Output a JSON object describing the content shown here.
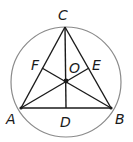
{
  "diagram": {
    "type": "geometry",
    "circle": {
      "cx": 66,
      "cy": 82,
      "r": 55,
      "stroke": "#8a8a8a"
    },
    "points": {
      "A": {
        "x": 21,
        "y": 108,
        "label": "A"
      },
      "B": {
        "x": 111,
        "y": 108,
        "label": "B"
      },
      "C": {
        "x": 65,
        "y": 27,
        "label": "C"
      },
      "D": {
        "x": 66,
        "y": 108,
        "label": "D"
      },
      "E": {
        "x": 89,
        "y": 68,
        "label": "E"
      },
      "F": {
        "x": 42,
        "y": 68,
        "label": "F"
      },
      "O": {
        "x": 66,
        "y": 81,
        "label": "O"
      }
    },
    "segments": [
      "AB",
      "BC",
      "CA",
      "CD",
      "AE",
      "BF"
    ],
    "line_color": "#1a1a1a"
  }
}
